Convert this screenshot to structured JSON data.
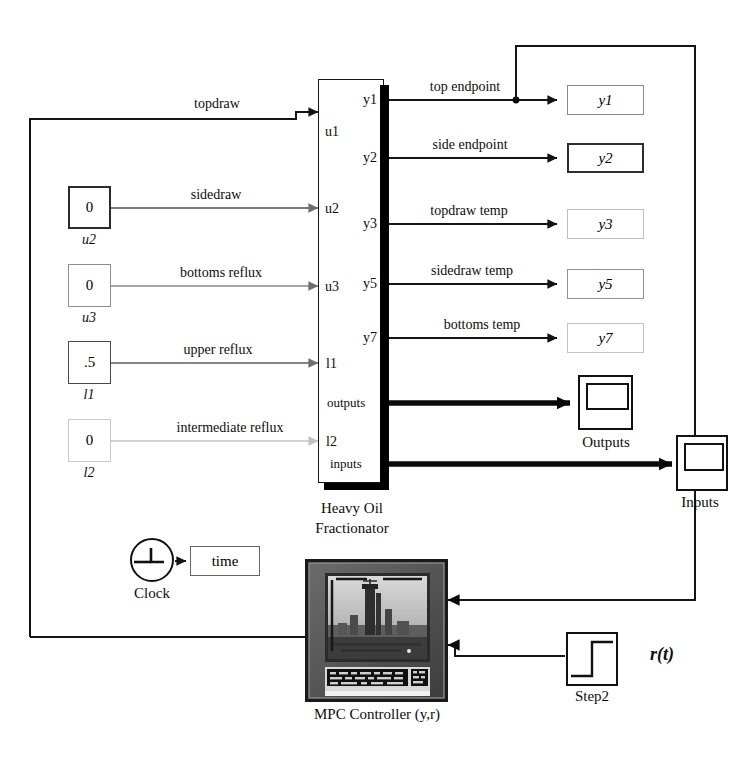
{
  "diagram": {
    "plant": {
      "name_line1": "Heavy Oil",
      "name_line2": "Fractionator",
      "inputs": [
        {
          "port": "u1",
          "label": "topdraw"
        },
        {
          "port": "u2",
          "label": "sidedraw"
        },
        {
          "port": "u3",
          "label": "bottoms reflux"
        },
        {
          "port": "l1",
          "label": "upper reflux"
        },
        {
          "port": "l2",
          "label": "intermediate reflux"
        }
      ],
      "outputs": [
        {
          "port": "y1",
          "label": "top endpoint",
          "display": "y1"
        },
        {
          "port": "y2",
          "label": "side endpoint",
          "display": "y2"
        },
        {
          "port": "y3",
          "label": "topdraw  temp",
          "display": "y3"
        },
        {
          "port": "y5",
          "label": "sidedraw  temp",
          "display": "y5"
        },
        {
          "port": "y7",
          "label": "bottoms temp",
          "display": "y7"
        }
      ],
      "bus_ports": [
        {
          "port": "outputs",
          "label": ""
        },
        {
          "port": "inputs",
          "label": "Outputs"
        }
      ]
    },
    "constants": [
      {
        "value": "0",
        "name": "u2"
      },
      {
        "value": "0",
        "name": "u3"
      },
      {
        "value": ".5",
        "name": "l1"
      },
      {
        "value": "0",
        "name": "l2"
      }
    ],
    "scopes": [
      {
        "name": "Outputs"
      },
      {
        "name": "Inputs"
      }
    ],
    "clock": {
      "name": "Clock",
      "display_label": "time",
      "icon": "clock-icon"
    },
    "controller": {
      "name": "MPC Controller (y,r)",
      "icon": "mpc-monitor-icon"
    },
    "step": {
      "name": "Step2",
      "signal_label": "r(t)",
      "icon": "step-icon"
    }
  },
  "colors": {
    "ink": "#0d0d0d",
    "wire_dark": "#141414",
    "wire_gray": "#6e6e6e",
    "wire_light": "#c2c2c2",
    "block_border": "#2b2b2b",
    "block_border_faint": "#b5b5b5"
  }
}
